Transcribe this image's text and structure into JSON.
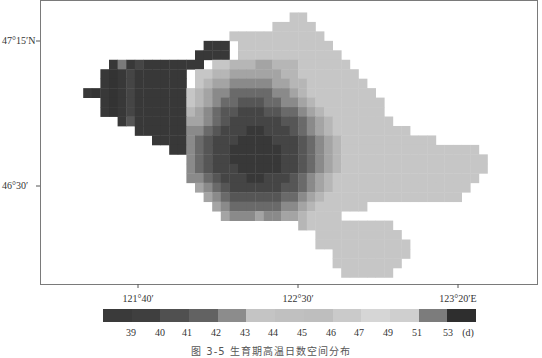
{
  "figure": {
    "caption": "图 3-5  生育期高温日数空间分布",
    "frame": {
      "left": 40,
      "top": 0,
      "right": 537,
      "bottom": 284
    }
  },
  "axes": {
    "y_ticks": [
      {
        "label": "47°15′N",
        "y": 41
      },
      {
        "label": "46°30′",
        "y": 186
      }
    ],
    "x_ticks": [
      {
        "label": "121°40′",
        "x": 138
      },
      {
        "label": "122°30′",
        "x": 298
      },
      {
        "label": "123°20′E",
        "x": 458
      }
    ]
  },
  "legend": {
    "unit": "(d)",
    "bins": [
      {
        "color": "#3a3a3a"
      },
      {
        "color": "#3f3f3f"
      },
      {
        "color": "#505050"
      },
      {
        "color": "#626262"
      },
      {
        "color": "#8c8c8c"
      },
      {
        "color": "#c4c4c4"
      },
      {
        "color": "#c0c0c0"
      },
      {
        "color": "#bebebe"
      },
      {
        "color": "#cacaca"
      },
      {
        "color": "#d6d6d6"
      },
      {
        "color": "#cfcfcf"
      },
      {
        "color": "#7c7c7c"
      },
      {
        "color": "#2e2e2e"
      }
    ],
    "labels": [
      {
        "text": "39",
        "x": 131
      },
      {
        "text": "40",
        "x": 160
      },
      {
        "text": "41",
        "x": 187
      },
      {
        "text": "42",
        "x": 216
      },
      {
        "text": "43",
        "x": 245
      },
      {
        "text": "44",
        "x": 273
      },
      {
        "text": "45",
        "x": 302
      },
      {
        "text": "46",
        "x": 331
      },
      {
        "text": "47",
        "x": 359
      },
      {
        "text": "49",
        "x": 388
      },
      {
        "text": "51",
        "x": 417
      },
      {
        "text": "53",
        "x": 448
      },
      {
        "text": "(d)",
        "x": 468
      }
    ]
  },
  "chart_data": {
    "type": "heatmap",
    "title": "图 3-5  生育期高温日数空间分布",
    "xlabel": "Longitude",
    "ylabel": "Latitude",
    "x_tick_labels": [
      "121°40′",
      "122°30′",
      "123°20′E"
    ],
    "y_tick_labels": [
      "47°15′N",
      "46°30′"
    ],
    "legend_title": "(d)",
    "legend_breaks": [
      39,
      40,
      41,
      42,
      43,
      44,
      45,
      46,
      47,
      49,
      51,
      53
    ],
    "color_scale": "grayscale; darkest at 39 and 53, lightest around 47-49",
    "grid": {
      "origin_x": 66,
      "origin_y": 3,
      "cell": 8.6,
      "levels_color": {
        "0": "#ffffff",
        "1": "#383838",
        "2": "#454545",
        "3": "#565656",
        "4": "#6a6a6a",
        "5": "#8a8a8a",
        "6": "#a4a4a4",
        "7": "#b6b6b6",
        "8": "#bebebe",
        "9": "#c6c6c6",
        "10": "#cecece",
        "11": "#d8d8d8",
        "12": "#7a7a7a",
        "13": "#333333"
      },
      "rows": [
        "000000000000000000000000000000000000000000000000000000",
        "000000000000000000000000009900000000000000000000000000",
        "000000000000000000000000999990000000000000000000000000",
        "000000000000000000099999999999000000000000000000000000",
        "000000000000000011109999999999900000000000000000000000",
        "0000000000000001111099999999999900000000000000000000000",
        "000001212111111109977766777999999000000000000000000000",
        "000013121111110997766666677999999900000000000000000000",
        "000013121111110976655555667799999990000000000000000000",
        "001313121111119765544444556799999999000000000000000000",
        "000013121111119765443334455679999999900000000000000000",
        "000013121111117654332223344567999999900000000000000000",
        "000000131111116654322222233456799999990000000000000000",
        "000000001111115543222112223456799999999900000000000000",
        "000000000011115432221111222345679999999999900000000000",
        "000000000000115432211111122345679999999999999999000000",
        "000000000000005432211111122345679999999999999999900000",
        "000000000000005432221111122345679999999999999999900000",
        "000000000000005543222112223456799999999999999999000000",
        "000000000000000654322222233456799999999999999990000000",
        "000000000000000065433333344567999999999999999900000000",
        "000000000000000006544444455679999990000000000000000000",
        "000000000000000000655565566799990000000000000000000000",
        "000000000000000000000000000799999999990000000000000000",
        "000000000000000000000000000009999999999000000000000000",
        "000000000000000000000000000009999999999900000000000000",
        "000000000000000000000000000000099999999900000000000000",
        "000000000000000000000000000000099999999000000000000000",
        "000000000000000000000000000000009999990000000000000000"
      ]
    }
  }
}
